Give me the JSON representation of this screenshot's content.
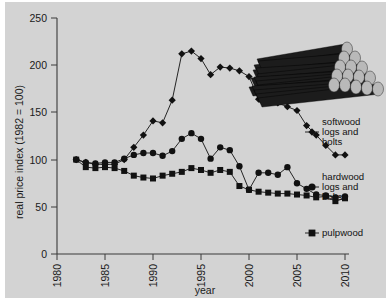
{
  "chart_data": {
    "type": "line",
    "title": "",
    "xlabel": "year",
    "ylabel": "real price index (1982 = 100)",
    "xlim": [
      1980,
      2011
    ],
    "ylim": [
      0,
      250
    ],
    "xticks": [
      1980,
      1985,
      1990,
      1995,
      2000,
      2005,
      2010
    ],
    "yticks": [
      0,
      50,
      100,
      150,
      200,
      250
    ],
    "grid": false,
    "legend_position": "right",
    "series": [
      {
        "name": "softwood logs and bolts",
        "marker": "diamond",
        "x": [
          1982,
          1983,
          1984,
          1985,
          1986,
          1987,
          1988,
          1989,
          1990,
          1991,
          1992,
          1993,
          1994,
          1995,
          1996,
          1997,
          1998,
          1999,
          2000,
          2001,
          2002,
          2003,
          2004,
          2005,
          2006,
          2007,
          2008,
          2009,
          2010
        ],
        "values": [
          100,
          97,
          95,
          95,
          95,
          100,
          113,
          126,
          141,
          139,
          163,
          212,
          215,
          207,
          190,
          198,
          197,
          194,
          188,
          164,
          170,
          160,
          156,
          152,
          136,
          126,
          115,
          105,
          105
        ]
      },
      {
        "name": "hardwood logs and bolts",
        "marker": "circle",
        "x": [
          1982,
          1983,
          1984,
          1985,
          1986,
          1987,
          1988,
          1989,
          1990,
          1991,
          1992,
          1993,
          1994,
          1995,
          1996,
          1997,
          1998,
          1999,
          2000,
          2001,
          2002,
          2003,
          2004,
          2005,
          2006,
          2007,
          2008,
          2009,
          2010
        ],
        "values": [
          100,
          97,
          96,
          97,
          97,
          101,
          105,
          107,
          107,
          104,
          109,
          122,
          128,
          122,
          101,
          113,
          110,
          93,
          68,
          86,
          86,
          84,
          92,
          75,
          69,
          63,
          62,
          60,
          61
        ]
      },
      {
        "name": "pulpwood",
        "marker": "square",
        "x": [
          1982,
          1983,
          1984,
          1985,
          1986,
          1987,
          1988,
          1989,
          1990,
          1991,
          1992,
          1993,
          1994,
          1995,
          1996,
          1997,
          1998,
          1999,
          2000,
          2001,
          2002,
          2003,
          2004,
          2005,
          2006,
          2007,
          2008,
          2009,
          2010
        ],
        "values": [
          100,
          92,
          91,
          92,
          91,
          88,
          83,
          81,
          80,
          83,
          85,
          87,
          91,
          89,
          86,
          89,
          87,
          72,
          68,
          66,
          65,
          64,
          64,
          63,
          62,
          60,
          61,
          56,
          59
        ]
      }
    ]
  },
  "legend": {
    "items": [
      {
        "marker": "diamond",
        "lines": [
          "softwood",
          "logs and",
          "bolts"
        ]
      },
      {
        "marker": "circle",
        "lines": [
          "hardwood",
          "logs and",
          "bolts"
        ]
      },
      {
        "marker": "square",
        "lines": [
          "pulpwood"
        ]
      }
    ]
  },
  "decoration": {
    "name": "log-pile-illustration",
    "log_body_color": "#1c1c1c",
    "log_end_color": "#b9b9b9"
  },
  "colors": {
    "background": "#d3d3d3",
    "page": "#ffffff",
    "ink": "#111111",
    "axis": "#3a3a3a"
  }
}
